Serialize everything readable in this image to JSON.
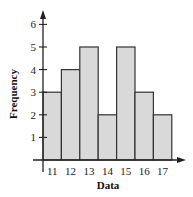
{
  "chart_data": {
    "type": "bar",
    "subtype": "histogram",
    "title": "",
    "xlabel": "Data",
    "ylabel": "Frequency",
    "categories": [
      "11",
      "12",
      "13",
      "14",
      "15",
      "16",
      "17"
    ],
    "values": [
      3,
      4,
      5,
      2,
      5,
      3,
      2
    ],
    "yticks": [
      1,
      2,
      3,
      4,
      5,
      6
    ],
    "ylim": [
      0,
      6.6
    ],
    "grid": false,
    "legend": null,
    "colors": {
      "bar_fill": "#d9d9d9",
      "bar_stroke": "#333333",
      "axis": "#222222"
    }
  }
}
